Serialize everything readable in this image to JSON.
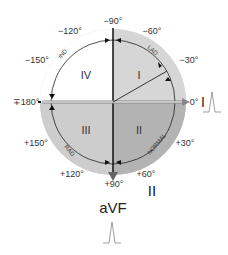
{
  "diagram": {
    "type": "hexaxial-cardiac-axis",
    "angle_labels": {
      "minus90": "−90°",
      "minus60": "−60°",
      "minus30": "−30°",
      "zero": "0°",
      "plus30": "+30°",
      "plus60": "+60°",
      "plus90": "+90°",
      "plus120": "+120°",
      "plus150": "+150°",
      "pm180": "∓180°",
      "minus150": "−150°",
      "minus120": "−120°"
    },
    "quadrants": {
      "q1": "I",
      "q2": "II",
      "q3": "III",
      "q4": "IV"
    },
    "arc_labels": {
      "lad": "LAD",
      "normal": "NORMAL",
      "rad": "RAD",
      "ind": "IND"
    },
    "leads": {
      "lead_i": "I",
      "lead_ii": "II",
      "lead_avf": "aVF"
    },
    "colors": {
      "q1": "#d4d4d4",
      "q2": "#b4b4b4",
      "q3": "#cfcfcf",
      "q4": "#ffffff",
      "ring": "#dcdcdc"
    }
  }
}
